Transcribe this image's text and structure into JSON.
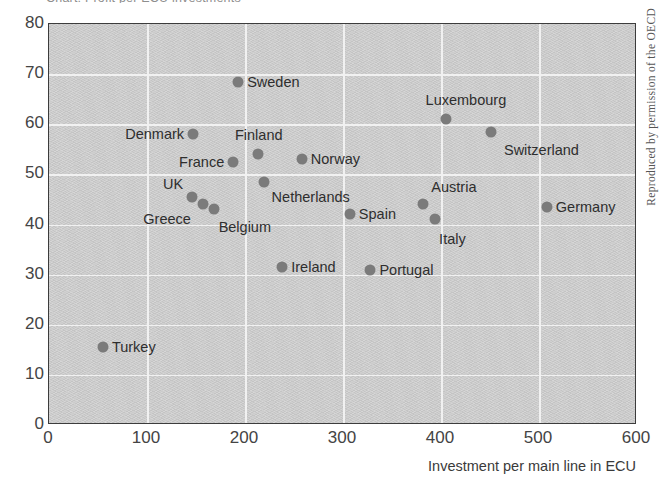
{
  "figure": {
    "title_clipped": "Chart: Profit per ECU investments",
    "credit": "Reproduced by permission of the OECD"
  },
  "chart_data": {
    "type": "scatter",
    "title": "",
    "xlabel": "Investment per main line in ECU",
    "ylabel": "",
    "xlim": [
      0,
      600
    ],
    "ylim": [
      0,
      80
    ],
    "xticks": [
      "0",
      "100",
      "200",
      "300",
      "400",
      "500",
      "600"
    ],
    "yticks": [
      "0",
      "10",
      "20",
      "30",
      "40",
      "50",
      "60",
      "70",
      "80"
    ],
    "grid": true,
    "legend": "none",
    "marker_color": "#7b7b7b",
    "plot_background": "#c9c9c9",
    "points": [
      {
        "label": "Sweden",
        "x": 193,
        "y": 68.5,
        "anchor": "right",
        "dx": 9,
        "dy": 0
      },
      {
        "label": "Luxembourg",
        "x": 405,
        "y": 61.0,
        "anchor": "center",
        "dx": 20,
        "dy": -19
      },
      {
        "label": "Switzerland",
        "x": 451,
        "y": 58.5,
        "anchor": "right",
        "dx": 13,
        "dy": 18
      },
      {
        "label": "Denmark",
        "x": 147,
        "y": 58.0,
        "anchor": "left",
        "dx": -9,
        "dy": 0
      },
      {
        "label": "Finland",
        "x": 213,
        "y": 54.0,
        "anchor": "center",
        "dx": 1,
        "dy": -19
      },
      {
        "label": "Norway",
        "x": 258,
        "y": 53.0,
        "anchor": "right",
        "dx": 9,
        "dy": 0
      },
      {
        "label": "France",
        "x": 188,
        "y": 52.5,
        "anchor": "left",
        "dx": -9,
        "dy": 0
      },
      {
        "label": "Netherlands",
        "x": 219,
        "y": 48.5,
        "anchor": "right",
        "dx": 8,
        "dy": 15
      },
      {
        "label": "UK",
        "x": 146,
        "y": 45.5,
        "anchor": "left",
        "dx": -9,
        "dy": -13
      },
      {
        "label": "Greece",
        "x": 157,
        "y": 44.0,
        "anchor": "left",
        "dx": -12,
        "dy": 15
      },
      {
        "label": "Belgium",
        "x": 168,
        "y": 43.0,
        "anchor": "right",
        "dx": 5,
        "dy": 18
      },
      {
        "label": "Germany",
        "x": 508,
        "y": 43.5,
        "anchor": "right",
        "dx": 9,
        "dy": 0
      },
      {
        "label": "Austria",
        "x": 382,
        "y": 44.0,
        "anchor": "right",
        "dx": 8,
        "dy": -17
      },
      {
        "label": "Italy",
        "x": 394,
        "y": 41.0,
        "anchor": "right",
        "dx": 4,
        "dy": 20
      },
      {
        "label": "Spain",
        "x": 307,
        "y": 42.0,
        "anchor": "right",
        "dx": 9,
        "dy": 0
      },
      {
        "label": "Ireland",
        "x": 238,
        "y": 31.5,
        "anchor": "right",
        "dx": 9,
        "dy": 0
      },
      {
        "label": "Portugal",
        "x": 328,
        "y": 31.0,
        "anchor": "right",
        "dx": 9,
        "dy": 0
      },
      {
        "label": "Turkey",
        "x": 55,
        "y": 15.5,
        "anchor": "right",
        "dx": 9,
        "dy": 0
      }
    ]
  }
}
